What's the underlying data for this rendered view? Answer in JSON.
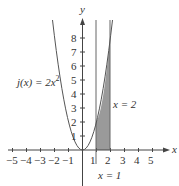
{
  "diagram": {
    "function_label": "j(x) = 2x²",
    "function_name": "j(x) = 2x",
    "function_exp": "2",
    "x_axis_label": "x",
    "y_axis_label": "y",
    "x_ticks": [
      "−5",
      "−4",
      "−3",
      "−2",
      "−1",
      "1",
      "2",
      "3",
      "4",
      "5"
    ],
    "y_ticks": [
      "1",
      "2",
      "3",
      "4",
      "5",
      "6",
      "7",
      "8"
    ],
    "line_label_x1": "x = 1",
    "line_label_x2": "x = 2",
    "shade_color": "#9a9a9a",
    "curve_color": "#555555"
  }
}
